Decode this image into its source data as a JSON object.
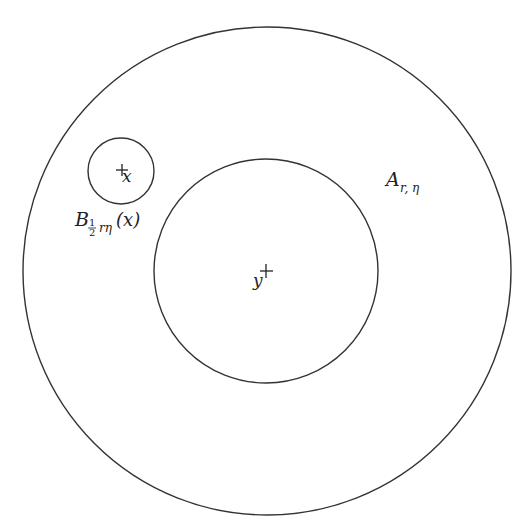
{
  "diagram": {
    "type": "annulus-with-ball",
    "stroke_color": "#333333",
    "background": "#ffffff",
    "outer_circle": {
      "cx": 267,
      "cy": 271,
      "r": 244
    },
    "inner_circle": {
      "cx": 266,
      "cy": 271,
      "r": 112
    },
    "small_circle": {
      "cx": 121,
      "cy": 171,
      "r": 33
    },
    "points": [
      {
        "name": "x",
        "cx": 123,
        "cy": 171,
        "label": "x"
      },
      {
        "name": "y",
        "cx": 266,
        "cy": 271,
        "label": "y"
      }
    ],
    "labels": {
      "annulus": {
        "main": "A",
        "subscript": "r, η"
      },
      "ball": {
        "main": "B",
        "sub_frac_num": "1",
        "sub_frac_den": "2",
        "sub_rest": "rη",
        "arg": "(x)"
      },
      "point_x": "x",
      "point_y": "y"
    }
  }
}
